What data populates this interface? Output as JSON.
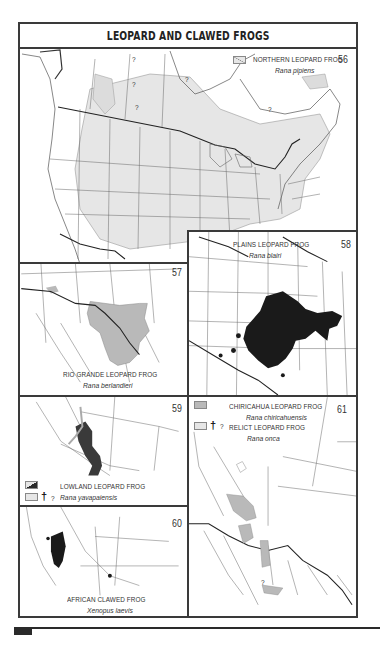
{
  "page": {
    "title": "LEOPARD AND CLAWED FROGS"
  },
  "colors": {
    "range_light_gray": "#e6e6e6",
    "range_mid_gray": "#b9b9b9",
    "range_black": "#1a1a1a",
    "border": "#3a3a3a",
    "map_lines": "#555555"
  },
  "maps": [
    {
      "number": "56",
      "common_name": "NORTHERN LEOPARD FROG",
      "scientific_name": "Rana pipiens",
      "legend": [
        {
          "swatch": "hatched-light",
          "label": "NORTHERN LEOPARD FROG"
        },
        {
          "swatch": "light-gray",
          "symbols": [
            "†",
            "?"
          ]
        }
      ],
      "question_marks": [
        "?",
        "?",
        "?",
        "?",
        "?"
      ]
    },
    {
      "number": "57",
      "common_name": "RIO GRANDE LEOPARD FROG",
      "scientific_name": "Rana berlandieri"
    },
    {
      "number": "58",
      "common_name": "PLAINS LEOPARD FROG",
      "scientific_name": "Rana blairi"
    },
    {
      "number": "59",
      "common_name": "LOWLAND LEOPARD FROG",
      "scientific_name": "Rana yavapaiensis",
      "legend": [
        {
          "swatch": "black-diagonal"
        },
        {
          "swatch": "light-gray",
          "symbols": [
            "†",
            "?"
          ]
        }
      ]
    },
    {
      "number": "60",
      "common_name": "AFRICAN CLAWED FROG",
      "scientific_name": "Xenopus laevis"
    },
    {
      "number": "61",
      "entries": [
        {
          "common_name": "CHIRICAHUA LEOPARD FROG",
          "scientific_name": "Rana chiricahuensis",
          "swatch": "mid-gray"
        },
        {
          "common_name": "RELICT LEOPARD FROG",
          "scientific_name": "Rana onca",
          "swatch": "light-gray",
          "symbols": [
            "†",
            "?"
          ]
        }
      ],
      "question_marks": [
        "?"
      ]
    }
  ]
}
